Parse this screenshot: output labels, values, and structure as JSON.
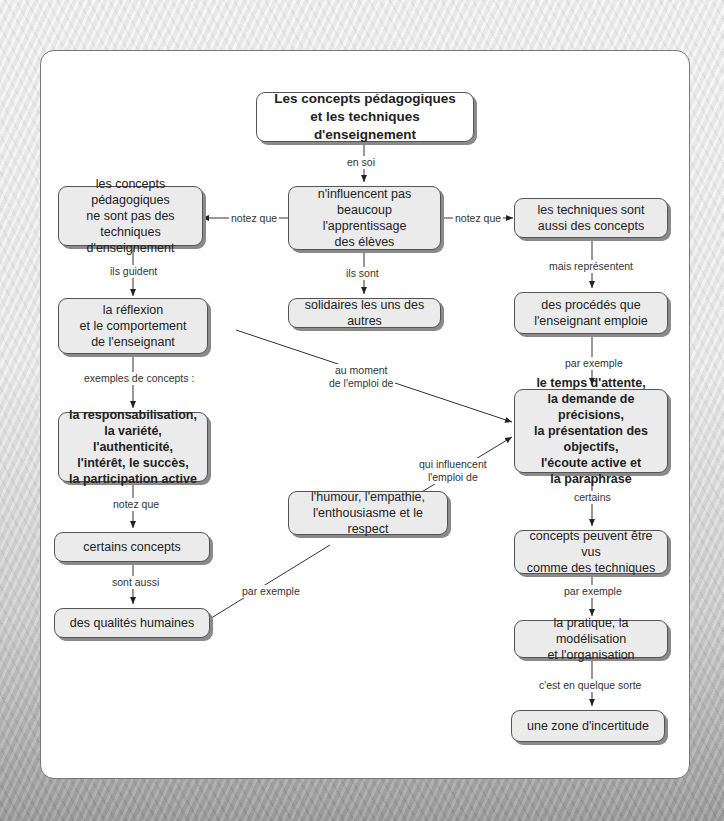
{
  "diagram": {
    "title": "Les concepts pédagogiques\net les techniques d'enseignement",
    "nodes": {
      "n_influence": "n'influencent pas\nbeaucoup l'apprentissage\ndes élèves",
      "concepts_not_techniques": "les concepts pédagogiques\nne sont pas des techniques\nd'enseignement",
      "techniques_concepts": "les techniques sont\naussi des concepts",
      "solidaires": "solidaires les uns des autres",
      "reflexion": "la réflexion\net le comportement\nde l'enseignant",
      "procedes": "des procédés que\nl'enseignant emploie",
      "concept_examples": "la responsabilisation,\nla variété, l'authenticité,\nl'intérêt, le succès,\nla participation active",
      "technique_examples": "le temps d'attente,\nla demande de précisions,\nla présentation des objectifs,\nl'écoute active et\nla paraphrase",
      "certains_concepts": "certains concepts",
      "humour": "l'humour, l'empathie,\nl'enthousiasme et le respect",
      "qualites": "des qualités humaines",
      "concepts_techniques": "concepts peuvent être vus\ncomme des techniques",
      "pratique": "la pratique, la modélisation\net l'organisation",
      "zone": "une zone d'incertitude"
    },
    "links": {
      "en_soi": "en soi",
      "notez_que_left": "notez que",
      "notez_que_right": "notez que",
      "ils_sont": "ils sont",
      "ils_guident": "ils guident",
      "mais_representent": "mais représentent",
      "par_exemple_1": "par exemple",
      "au_moment": "au moment\nde l'emploi de",
      "exemples_concepts": "exemples de concepts :",
      "qui_influencent": "qui influencent\nl'emploi de",
      "notez_que_2": "notez que",
      "certains": "certains",
      "sont_aussi": "sont aussi",
      "par_exemple_2": "par exemple",
      "par_exemple_3": "par exemple",
      "c_est_en": "c'est en quelque sorte"
    }
  }
}
